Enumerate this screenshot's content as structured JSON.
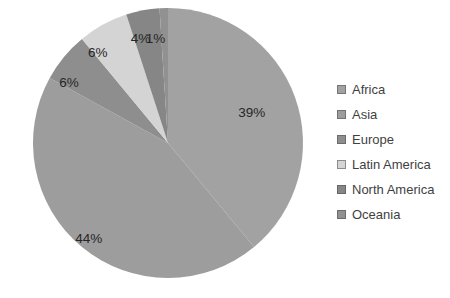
{
  "chart_data": {
    "type": "pie",
    "title": "",
    "categories": [
      "Africa",
      "Asia",
      "Europe",
      "Latin America",
      "North America",
      "Oceania"
    ],
    "values": [
      39,
      44,
      6,
      6,
      4,
      1
    ],
    "data_labels": [
      "39%",
      "44%",
      "6%",
      "6%",
      "4%",
      "1%"
    ],
    "colors": [
      "#a2a2a2",
      "#9d9d9d",
      "#8e8e8e",
      "#d4d4d4",
      "#868686",
      "#919191"
    ],
    "legend_position": "right",
    "direction": "clockwise",
    "start_angle_deg": 0,
    "background": "#ffffff",
    "label_color": "#262626",
    "legend_text_color": "#3f3f3f",
    "pie_geometry": {
      "cx": 168,
      "cy": 143,
      "r": 135
    },
    "label_radius_fractions": [
      0.66,
      0.92,
      0.86,
      0.85,
      0.8,
      0.78
    ],
    "label_angle_offsets_deg": [
      0,
      0,
      -8,
      -9,
      -4,
      -5
    ]
  }
}
